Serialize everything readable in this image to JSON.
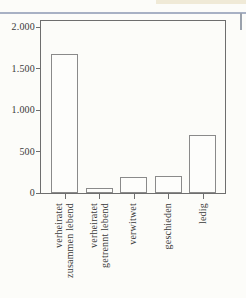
{
  "page": {
    "background": "#fcfcf9",
    "description": "Scanned textbook page with a bar chart of marital-status frequencies"
  },
  "decorations": {
    "top_rule_color": "#a8b1c4",
    "corner_strip_color": "#f0ead7",
    "right_mark_color": "#9aa1ac"
  },
  "chart_data": {
    "type": "bar",
    "title": "",
    "categories": [
      "verheiratet zusammen lebend",
      "verheiratet getrennt lebend",
      "verwitwet",
      "geschieden",
      "ledig"
    ],
    "category_lines": [
      [
        "verheiratet",
        "zusammen lebend"
      ],
      [
        "verheiratet",
        "getrennt lebend"
      ],
      [
        "verwitwet"
      ],
      [
        "geschieden"
      ],
      [
        "ledig"
      ]
    ],
    "values": [
      1670,
      60,
      190,
      200,
      700
    ],
    "xlabel": "",
    "ylabel": "",
    "ylim": [
      0,
      2000
    ],
    "yticks": [
      0,
      500,
      1000,
      1500,
      2000
    ],
    "ytick_labels": [
      "0",
      "500",
      "1.000",
      "1.500",
      "2.000"
    ],
    "grid": false,
    "legend_position": "none",
    "bar_fill": "#fdfdfb",
    "bar_border": "#8a8a8a",
    "axis_color": "#6e6e6e",
    "text_color": "#3a3a3a"
  }
}
